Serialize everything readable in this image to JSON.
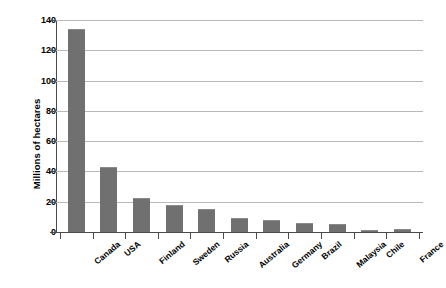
{
  "chart_data": {
    "type": "bar",
    "title": "",
    "xlabel": "",
    "ylabel": "Millions of hectares",
    "ylim": [
      0,
      140
    ],
    "yticks": [
      0,
      20,
      40,
      60,
      80,
      100,
      120,
      140
    ],
    "grid": true,
    "legend": null,
    "bar_color": "#707070",
    "categories": [
      "Canada",
      "USA",
      "Finland",
      "Sweden",
      "Russia",
      "Australia",
      "Germany",
      "Brazil",
      "Malaysia",
      "Chile",
      "France"
    ],
    "values": [
      134,
      43,
      22.5,
      18,
      15.5,
      9,
      8,
      6,
      5,
      1.5,
      2
    ]
  },
  "axes": {
    "y_title": "Millions of hectares",
    "y_tick_labels": [
      "140",
      "120",
      "100",
      "80",
      "60",
      "40",
      "20",
      "0"
    ],
    "x_tick_labels": [
      "Canada",
      "USA",
      "Finland",
      "Sweden",
      "Russia",
      "Australia",
      "Germany",
      "Brazil",
      "Malaysia",
      "Chile",
      "France"
    ]
  }
}
